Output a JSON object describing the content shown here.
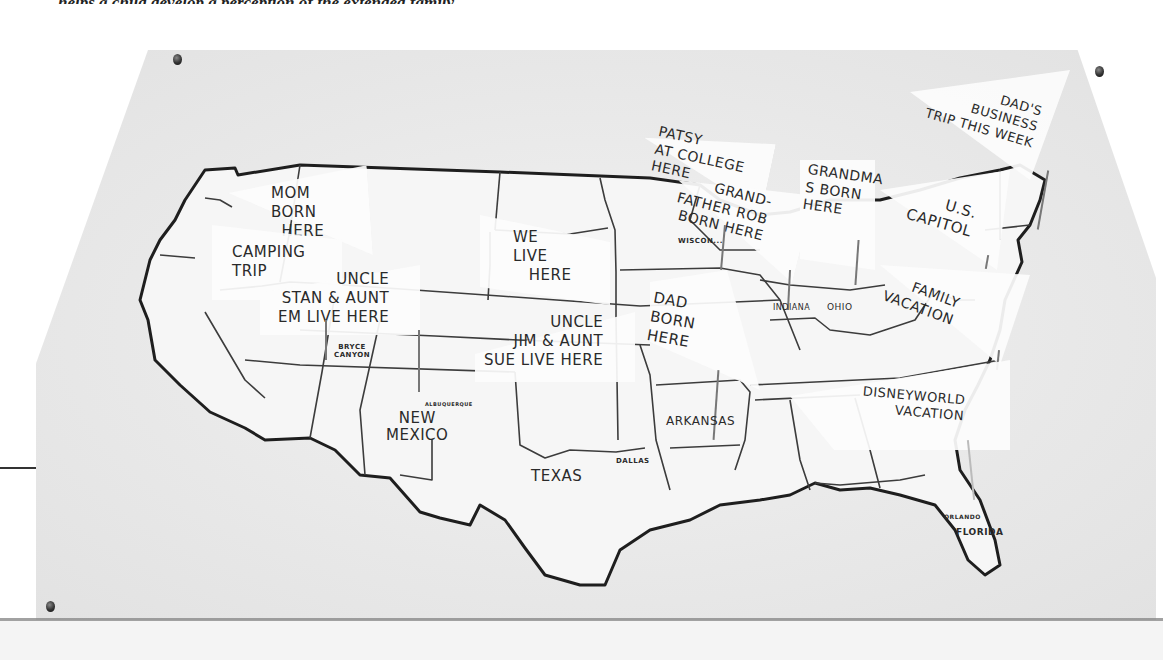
{
  "caption": "helps a child develop a perception of the extended family.",
  "map": {
    "title": "Family map of the United States",
    "state_labels": [
      {
        "name": "TEXAS",
        "x": 531,
        "y": 467
      },
      {
        "name": "NEW\nMEXICO",
        "x": 386,
        "y": 410
      },
      {
        "name": "ARKANSAS",
        "x": 666,
        "y": 414
      },
      {
        "name": "INDIANA",
        "x": 773,
        "y": 303
      },
      {
        "name": "OHIO",
        "x": 827,
        "y": 302
      },
      {
        "name": "FLORIDA",
        "x": 956,
        "y": 527
      },
      {
        "name": "WISCON...",
        "x": 678,
        "y": 237
      }
    ],
    "place_labels": [
      {
        "name": "BRYCE\nCANYON",
        "x": 334,
        "y": 344
      },
      {
        "name": "ALBUQUERQUE",
        "x": 425,
        "y": 401
      },
      {
        "name": "DALLAS",
        "x": 616,
        "y": 457
      },
      {
        "name": "ORLANDO",
        "x": 944,
        "y": 513
      }
    ],
    "flags": [
      {
        "id": "mom-born",
        "text": "MOM\nBORN\n  HERE"
      },
      {
        "id": "camping-trip",
        "text": "CAMPING\nTRIP"
      },
      {
        "id": "uncle-stan",
        "text": "UNCLE\nSTAN & AUNT\nEM LIVE HERE"
      },
      {
        "id": "we-live",
        "text": "WE\nLIVE\n   HERE"
      },
      {
        "id": "uncle-jim",
        "text": "UNCLE\nJIM & AUNT\nSUE LIVE HERE"
      },
      {
        "id": "patsy-college",
        "text": "PATSY\nAT COLLEGE\nHERE"
      },
      {
        "id": "grandfather-rob",
        "text": "GRAND-\nFATHER ROB\nBORN HERE"
      },
      {
        "id": "grandma-born",
        "text": "GRANDMA\nS BORN\nHERE"
      },
      {
        "id": "dad-born",
        "text": "DAD\nBORN\nHERE"
      },
      {
        "id": "dads-business-trip",
        "text": "DAD'S\nBUSINESS\nTRIP THIS WEEK"
      },
      {
        "id": "us-capitol",
        "text": "U.S.\nCAPITOL"
      },
      {
        "id": "family-vacation",
        "text": "FAMILY\nVACATION"
      },
      {
        "id": "disneyworld-vacation",
        "text": "DISNEYWORLD\nVACATION"
      }
    ]
  }
}
